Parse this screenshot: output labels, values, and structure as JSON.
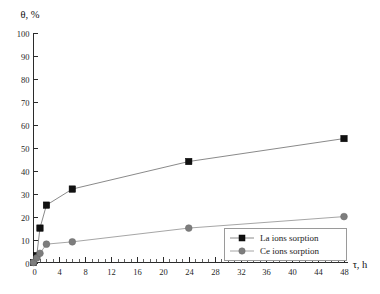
{
  "chart_data": {
    "type": "line",
    "title": "",
    "xlabel": "τ, h",
    "ylabel": "θ, %",
    "xlim": [
      0,
      48
    ],
    "ylim": [
      0,
      100
    ],
    "x_major_step": 4,
    "x_minor_step": 1,
    "y_major_step": 10,
    "grid": false,
    "legend_position": "bottom-right",
    "x": [
      0,
      0.5,
      1,
      2,
      6,
      24,
      48
    ],
    "series": [
      {
        "name": "La ions sorption",
        "marker": "square",
        "color": "#111111",
        "values": [
          0,
          3,
          15,
          25,
          32,
          44,
          54
        ]
      },
      {
        "name": "Ce ions sorption",
        "marker": "circle",
        "color": "#7d7d7d",
        "values": [
          0,
          2,
          4,
          8,
          9,
          15,
          20
        ]
      }
    ],
    "x_tick_labels": [
      "0",
      "4",
      "8",
      "12",
      "16",
      "20",
      "24",
      "28",
      "32",
      "36",
      "40",
      "44",
      "48"
    ],
    "y_tick_labels": [
      "0",
      "10",
      "20",
      "30",
      "40",
      "50",
      "60",
      "70",
      "80",
      "90",
      "100"
    ]
  },
  "legend": {
    "entries": [
      {
        "label": "La ions sorption"
      },
      {
        "label": "Ce ions sorption"
      }
    ]
  },
  "axes": {
    "y_axis_title": "θ, %",
    "x_axis_title": "τ, h"
  }
}
